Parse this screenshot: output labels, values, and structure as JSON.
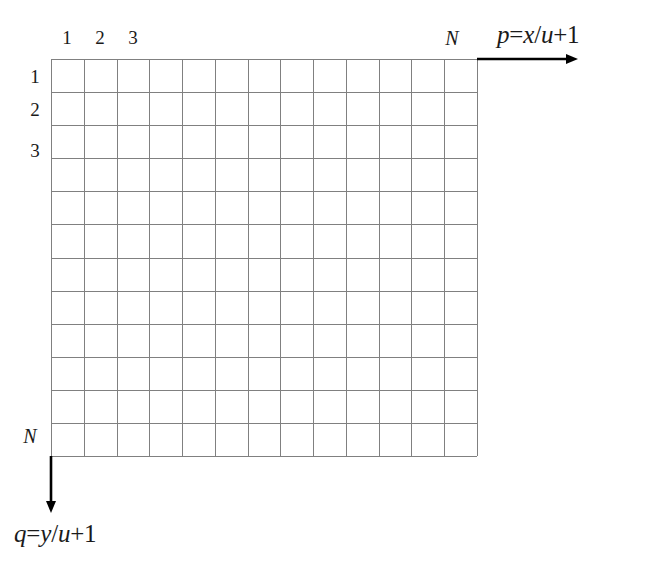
{
  "figure": {
    "type": "grid-diagram",
    "title": "",
    "background_color": "#ffffff",
    "grid_line_color": "#808080",
    "axis_color": "#000000",
    "text_color": "#1a1a1a"
  },
  "grid": {
    "columns": 13,
    "rows": 12,
    "origin_x": 51,
    "origin_y": 59,
    "cell_width": 32.77,
    "cell_height": 33.08,
    "right_edge_x": 477,
    "bottom_edge_y": 456
  },
  "column_labels": {
    "first": "1",
    "second": "2",
    "third": "3",
    "last": "N"
  },
  "row_labels": {
    "first": "1",
    "second": "2",
    "third": "3",
    "last": "N"
  },
  "axes": {
    "horizontal": {
      "label": "p=x/u+1",
      "label_parts": {
        "var": "p",
        "equals": "=",
        "numerator": "x",
        "slash": "/",
        "denominator": "u",
        "plus_one": "+1"
      },
      "direction": "right",
      "start_x": 477,
      "start_y": 59,
      "end_x": 578
    },
    "vertical": {
      "label": "q=y/u+1",
      "label_parts": {
        "var": "q",
        "equals": "=",
        "numerator": "y",
        "slash": "/",
        "denominator": "u",
        "plus_one": "+1"
      },
      "direction": "down",
      "start_x": 51,
      "start_y": 456,
      "end_y": 513
    }
  },
  "chart_data": {
    "type": "table",
    "title": "",
    "xlabel": "p=x/u+1",
    "ylabel": "q=y/u+1",
    "grid": true,
    "columns": 13,
    "rows": 12,
    "column_ticks": [
      "1",
      "2",
      "3",
      "N"
    ],
    "row_ticks": [
      "1",
      "2",
      "3",
      "N"
    ],
    "annotations": [
      "p=x/u+1",
      "q=y/u+1"
    ],
    "values": []
  }
}
